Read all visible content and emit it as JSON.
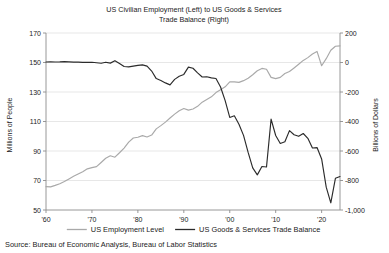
{
  "chart_data": {
    "type": "line",
    "title": "US Civilian Employment (Left) to US Goods & Services Trade Balance (Right)",
    "title_line1": "US Civilian Employment (Left) to US Goods & Services",
    "title_line2": "Trade Balance (Right)",
    "xlabel": "",
    "ylabel": "Millions of People",
    "y2label": "Billions of Dollars",
    "xlim": [
      1960,
      2024
    ],
    "ylim": [
      50,
      170
    ],
    "y2lim": [
      -1000,
      200
    ],
    "yticks": [
      50,
      70,
      90,
      110,
      130,
      150,
      170
    ],
    "yticklabels": [
      "50",
      "70",
      "90",
      "110",
      "130",
      "150",
      "170"
    ],
    "y2ticks": [
      -1000,
      -800,
      -600,
      -400,
      -200,
      0,
      200
    ],
    "y2ticklabels": [
      "-1,000",
      "-800",
      "-600",
      "-400",
      "-200",
      "0",
      "200"
    ],
    "xticks": [
      1960,
      1970,
      1980,
      1990,
      2000,
      2010,
      2020
    ],
    "xticklabels": [
      "'60",
      "'70",
      "'80",
      "'90",
      "'00",
      "'10",
      "'20"
    ],
    "grid": "horizontal",
    "legend_position": "bottom",
    "series": [
      {
        "name": "US Employment Level",
        "axis": "left",
        "color": "#a9a9a9",
        "x": [
          1960,
          1961,
          1962,
          1963,
          1964,
          1965,
          1966,
          1967,
          1968,
          1969,
          1970,
          1971,
          1972,
          1973,
          1974,
          1975,
          1976,
          1977,
          1978,
          1979,
          1980,
          1981,
          1982,
          1983,
          1984,
          1985,
          1986,
          1987,
          1988,
          1989,
          1990,
          1991,
          1992,
          1993,
          1994,
          1995,
          1996,
          1997,
          1998,
          1999,
          2000,
          2001,
          2002,
          2003,
          2004,
          2005,
          2006,
          2007,
          2008,
          2009,
          2010,
          2011,
          2012,
          2013,
          2014,
          2015,
          2016,
          2017,
          2018,
          2019,
          2020,
          2021,
          2022,
          2023,
          2024
        ],
        "values": [
          65.8,
          65.7,
          66.7,
          67.8,
          69.3,
          71.1,
          72.9,
          74.4,
          75.9,
          77.9,
          78.7,
          79.4,
          82.2,
          85.1,
          86.8,
          85.8,
          88.8,
          92.0,
          96.0,
          98.8,
          99.3,
          100.4,
          99.5,
          100.8,
          105.0,
          107.2,
          109.6,
          112.4,
          115.0,
          117.3,
          118.8,
          117.7,
          118.5,
          120.3,
          123.1,
          124.9,
          126.7,
          129.6,
          131.5,
          133.5,
          136.9,
          136.9,
          136.5,
          137.7,
          139.3,
          141.7,
          144.4,
          146.0,
          145.4,
          139.9,
          139.1,
          139.9,
          142.5,
          143.9,
          146.3,
          148.8,
          151.4,
          153.3,
          155.8,
          157.5,
          147.8,
          152.6,
          158.3,
          161.0,
          161.3
        ]
      },
      {
        "name": "US Goods & Services Trade Balance",
        "axis": "right",
        "color": "#2b2b2b",
        "x": [
          1960,
          1961,
          1962,
          1963,
          1964,
          1965,
          1966,
          1967,
          1968,
          1969,
          1970,
          1971,
          1972,
          1973,
          1974,
          1975,
          1976,
          1977,
          1978,
          1979,
          1980,
          1981,
          1982,
          1983,
          1984,
          1985,
          1986,
          1987,
          1988,
          1989,
          1990,
          1991,
          1992,
          1993,
          1994,
          1995,
          1996,
          1997,
          1998,
          1999,
          2000,
          2001,
          2002,
          2003,
          2004,
          2005,
          2006,
          2007,
          2008,
          2009,
          2010,
          2011,
          2012,
          2013,
          2014,
          2015,
          2016,
          2017,
          2018,
          2019,
          2020,
          2021,
          2022,
          2023,
          2024
        ],
        "values": [
          3.5,
          4.4,
          3.4,
          4.2,
          6.4,
          4.7,
          2.6,
          2.3,
          0.5,
          0.4,
          2.0,
          -1.7,
          -5.4,
          1.9,
          -4.3,
          12.4,
          -6.1,
          -27.2,
          -29.8,
          -24.6,
          -19.4,
          -16.2,
          -24.2,
          -57.8,
          -109.1,
          -121.9,
          -138.3,
          -151.7,
          -114.6,
          -93.1,
          -80.9,
          -31.1,
          -39.2,
          -70.3,
          -98.5,
          -96.4,
          -104.1,
          -108.3,
          -166.1,
          -258.6,
          -372.5,
          -361.5,
          -418.0,
          -493.9,
          -609.9,
          -714.2,
          -761.7,
          -705.4,
          -708.7,
          -383.8,
          -494.7,
          -548.6,
          -537.6,
          -461.9,
          -490.2,
          -500.4,
          -481.2,
          -513.8,
          -579.9,
          -576.9,
          -653.9,
          -845.0,
          -951.2,
          -784.9,
          -773.4
        ]
      }
    ],
    "legend": [
      {
        "label": "US Employment Level",
        "color": "#a9a9a9"
      },
      {
        "label": "US Goods & Services Trade Balance",
        "color": "#2b2b2b"
      }
    ],
    "source": "Source: Bureau of Economic Analysis, Bureau of Labor Statistics"
  }
}
